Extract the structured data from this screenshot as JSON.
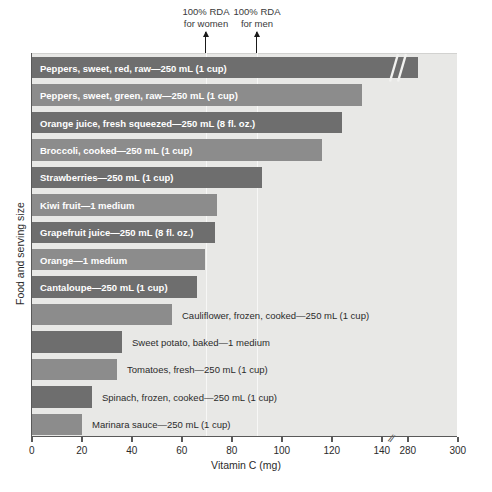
{
  "chart_data": {
    "type": "bar",
    "orientation": "horizontal",
    "title": "",
    "xlabel": "Vitamin C (mg)",
    "ylabel": "Food and serving size",
    "xlim": [
      0,
      300
    ],
    "xticks": [
      0,
      20,
      40,
      60,
      80,
      100,
      120,
      140,
      280,
      300
    ],
    "xticklabels": [
      "0",
      "20",
      "40",
      "60",
      "80",
      "100",
      "120",
      "140",
      "280",
      "300"
    ],
    "axis_break": {
      "after": 140,
      "before": 280,
      "marker": "//"
    },
    "grid": false,
    "legend": "none",
    "categories": [
      "Peppers, sweet, red, raw—250 mL (1 cup)",
      "Peppers, sweet, green, raw—250 mL (1 cup)",
      "Orange juice, fresh squeezed—250 mL (8 fl. oz.)",
      "Broccoli, cooked—250 mL (1 cup)",
      "Strawberries—250 mL (1 cup)",
      "Kiwi fruit—1 medium",
      "Grapefruit juice—250 mL (8 fl. oz.)",
      "Orange—1 medium",
      "Cantaloupe—250 mL (1 cup)",
      "Cauliflower, frozen, cooked—250 mL (1 cup)",
      "Sweet potato, baked—1 medium",
      "Tomatoes, fresh—250 mL (1 cup)",
      "Spinach, frozen, cooked—250 mL (1 cup)",
      "Marinara sauce—250 mL (1 cup)"
    ],
    "values": [
      284,
      132,
      124,
      116,
      92,
      74,
      73,
      69,
      66,
      56,
      36,
      34,
      24,
      20
    ],
    "annotations": [
      {
        "label": "100% RDA for women",
        "value": 70,
        "style": "arrow"
      },
      {
        "label": "100% RDA for men",
        "value": 90,
        "style": "arrow"
      }
    ]
  },
  "annotations": {
    "women": {
      "line1": "100% RDA",
      "line2": "for women"
    },
    "men": {
      "line1": "100% RDA",
      "line2": "for men"
    }
  },
  "axis": {
    "xlabel": "Vitamin C (mg)",
    "ylabel": "Food and serving size",
    "break_marker": "//"
  },
  "colors": {
    "bar_dark": "#6e6e6e",
    "bar_light": "#8c8c8c",
    "plot_background": "#e8e8e6",
    "axis": "#595959",
    "label_inside": "#ffffff",
    "label_outside": "#2b2b2b"
  },
  "bars": [
    {
      "label": "Peppers, sweet, red, raw—250 mL (1 cup)",
      "value": 284,
      "label_inside": true
    },
    {
      "label": "Peppers, sweet, green, raw—250 mL (1 cup)",
      "value": 132,
      "label_inside": true
    },
    {
      "label": "Orange juice, fresh squeezed—250 mL (8 fl. oz.)",
      "value": 124,
      "label_inside": true
    },
    {
      "label": "Broccoli, cooked—250 mL (1 cup)",
      "value": 116,
      "label_inside": true
    },
    {
      "label": "Strawberries—250 mL (1 cup)",
      "value": 92,
      "label_inside": true
    },
    {
      "label": "Kiwi fruit—1 medium",
      "value": 74,
      "label_inside": true
    },
    {
      "label": "Grapefruit juice—250 mL (8 fl. oz.)",
      "value": 73,
      "label_inside": true
    },
    {
      "label": "Orange—1 medium",
      "value": 69,
      "label_inside": true
    },
    {
      "label": "Cantaloupe—250 mL (1 cup)",
      "value": 66,
      "label_inside": true
    },
    {
      "label": "Cauliflower, frozen, cooked—250 mL (1 cup)",
      "value": 56,
      "label_inside": false
    },
    {
      "label": "Sweet potato, baked—1 medium",
      "value": 36,
      "label_inside": false
    },
    {
      "label": "Tomatoes, fresh—250 mL (1 cup)",
      "value": 34,
      "label_inside": false
    },
    {
      "label": "Spinach, frozen, cooked—250 mL (1 cup)",
      "value": 24,
      "label_inside": false
    },
    {
      "label": "Marinara sauce—250 mL (1 cup)",
      "value": 20,
      "label_inside": false
    }
  ],
  "xticklabels": [
    "0",
    "20",
    "40",
    "60",
    "80",
    "100",
    "120",
    "140",
    "280",
    "300"
  ]
}
